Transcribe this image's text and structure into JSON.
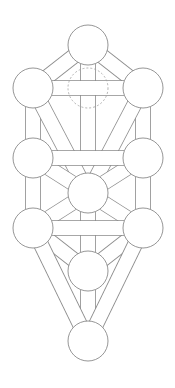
{
  "diagram": {
    "title": "Tree of Life",
    "stroke_color": "#8a8a8a",
    "fill_color": "#ffffff",
    "background": "#ffffff",
    "sephirot": [
      {
        "id": "kether",
        "cx": 88,
        "cy": 45,
        "r": 20
      },
      {
        "id": "chokmah",
        "cx": 143,
        "cy": 88,
        "r": 20
      },
      {
        "id": "binah",
        "cx": 33,
        "cy": 88,
        "r": 20
      },
      {
        "id": "chesed",
        "cx": 143,
        "cy": 158,
        "r": 20
      },
      {
        "id": "geburah",
        "cx": 33,
        "cy": 158,
        "r": 20
      },
      {
        "id": "tiphareth",
        "cx": 88,
        "cy": 193,
        "r": 20
      },
      {
        "id": "netzach",
        "cx": 143,
        "cy": 228,
        "r": 20
      },
      {
        "id": "hod",
        "cx": 33,
        "cy": 228,
        "r": 20
      },
      {
        "id": "yesod",
        "cx": 88,
        "cy": 271,
        "r": 20
      },
      {
        "id": "malkuth",
        "cx": 88,
        "cy": 341,
        "r": 20
      }
    ],
    "daath": {
      "id": "daath",
      "cx": 88,
      "cy": 88,
      "r": 20,
      "dashed": true
    },
    "paths": [
      [
        "binah",
        "geburah"
      ],
      [
        "geburah",
        "hod"
      ],
      [
        "chokmah",
        "chesed"
      ],
      [
        "chesed",
        "netzach"
      ],
      [
        "kether",
        "tiphareth"
      ],
      [
        "tiphareth",
        "yesod"
      ],
      [
        "yesod",
        "malkuth"
      ],
      [
        "binah",
        "tiphareth"
      ],
      [
        "chokmah",
        "tiphareth"
      ],
      [
        "geburah",
        "tiphareth"
      ],
      [
        "chesed",
        "tiphareth"
      ],
      [
        "hod",
        "tiphareth"
      ],
      [
        "netzach",
        "tiphareth"
      ],
      [
        "hod",
        "yesod"
      ],
      [
        "netzach",
        "yesod"
      ],
      [
        "hod",
        "malkuth"
      ],
      [
        "netzach",
        "malkuth"
      ],
      [
        "kether",
        "binah"
      ],
      [
        "kether",
        "chokmah"
      ],
      [
        "binah",
        "chokmah"
      ],
      [
        "geburah",
        "chesed"
      ],
      [
        "hod",
        "netzach"
      ]
    ],
    "path_width": 14
  }
}
